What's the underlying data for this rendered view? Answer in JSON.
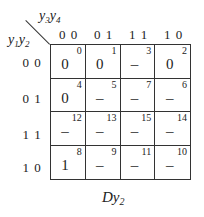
{
  "kmap": {
    "col_var": {
      "base": "y",
      "parts": [
        [
          "y",
          "3"
        ],
        [
          "y",
          "4"
        ]
      ]
    },
    "row_var": {
      "base": "y",
      "parts": [
        [
          "y",
          "1"
        ],
        [
          "y",
          "2"
        ]
      ]
    },
    "col_headers": [
      "0 0",
      "0 1",
      "1 1",
      "1 0"
    ],
    "row_headers": [
      "0 0",
      "0 1",
      "1 1",
      "1 0"
    ],
    "cells": [
      [
        {
          "index": "0",
          "value": "0"
        },
        {
          "index": "1",
          "value": "0"
        },
        {
          "index": "3",
          "value": "–"
        },
        {
          "index": "2",
          "value": "0"
        }
      ],
      [
        {
          "index": "4",
          "value": "0"
        },
        {
          "index": "5",
          "value": "–"
        },
        {
          "index": "7",
          "value": "–"
        },
        {
          "index": "6",
          "value": "–"
        }
      ],
      [
        {
          "index": "12",
          "value": "–"
        },
        {
          "index": "13",
          "value": "–"
        },
        {
          "index": "15",
          "value": "–"
        },
        {
          "index": "14",
          "value": "–"
        }
      ],
      [
        {
          "index": "8",
          "value": "1"
        },
        {
          "index": "9",
          "value": "–"
        },
        {
          "index": "11",
          "value": "–"
        },
        {
          "index": "10",
          "value": "–"
        }
      ]
    ],
    "caption": {
      "main": "Dy",
      "sub": "2"
    }
  }
}
